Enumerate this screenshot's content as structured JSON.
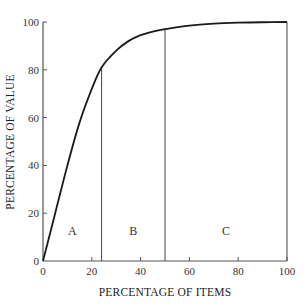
{
  "chart_data": {
    "type": "line",
    "title": "",
    "xlabel": "PERCENTAGE OF ITEMS",
    "ylabel": "PERCENTAGE OF VALUE",
    "xlim": [
      0,
      100
    ],
    "ylim": [
      0,
      100
    ],
    "x_ticks": [
      0,
      20,
      40,
      60,
      80,
      100
    ],
    "y_ticks": [
      0,
      20,
      40,
      60,
      80,
      100
    ],
    "grid": false,
    "legend": null,
    "series": [
      {
        "name": "cumulative value (ABC / Pareto curve)",
        "x": [
          0,
          5,
          10,
          15,
          20,
          24,
          30,
          35,
          40,
          45,
          50,
          60,
          70,
          80,
          90,
          100
        ],
        "y": [
          0,
          20,
          40,
          58,
          72,
          81,
          88,
          92,
          94.5,
          96,
          97,
          98.5,
          99.3,
          99.7,
          99.9,
          100
        ]
      }
    ],
    "zones": [
      {
        "label": "A",
        "x_start": 0,
        "x_end": 24,
        "boundary_y": 81
      },
      {
        "label": "B",
        "x_start": 24,
        "x_end": 50,
        "boundary_y": 97
      },
      {
        "label": "C",
        "x_start": 50,
        "x_end": 100,
        "boundary_y": 100
      }
    ]
  },
  "labels": {
    "x_axis_title": "PERCENTAGE OF ITEMS",
    "y_axis_title": "PERCENTAGE OF VALUE",
    "zone_a": "A",
    "zone_b": "B",
    "zone_c": "C"
  },
  "colors": {
    "curve": "#1a1a1a",
    "axes": "#555555",
    "dividers": "#555555",
    "background": "#ffffff"
  }
}
